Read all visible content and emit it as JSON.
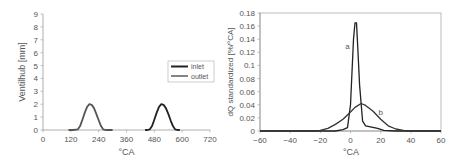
{
  "chart_data": [
    {
      "type": "line",
      "title": "",
      "xlabel": "°CA",
      "ylabel": "Ventilhub [mm]",
      "xlim": [
        0,
        720
      ],
      "ylim": [
        0,
        9
      ],
      "x_ticks": [
        0,
        120,
        240,
        360,
        480,
        600,
        720
      ],
      "y_ticks": [
        0,
        1,
        2,
        3,
        4,
        5,
        6,
        7,
        8,
        9
      ],
      "grid": false,
      "legend_position": "right-middle",
      "series": [
        {
          "name": "inlet",
          "color": "#222222",
          "x": [
            440,
            450,
            460,
            470,
            480,
            490,
            500,
            510,
            520,
            530,
            540,
            550,
            560,
            570,
            580,
            590
          ],
          "values": [
            0,
            0,
            0.05,
            0.3,
            0.8,
            1.35,
            1.8,
            2.0,
            1.95,
            1.7,
            1.25,
            0.75,
            0.3,
            0.05,
            0,
            0
          ]
        },
        {
          "name": "outlet",
          "color": "#555555",
          "x": [
            110,
            130,
            150,
            160,
            170,
            180,
            190,
            200,
            210,
            220,
            230,
            240,
            250,
            260,
            270,
            280,
            300
          ],
          "values": [
            0,
            0,
            0.05,
            0.3,
            0.8,
            1.35,
            1.8,
            2.0,
            1.95,
            1.7,
            1.25,
            0.75,
            0.3,
            0.05,
            0,
            0,
            0
          ]
        }
      ]
    },
    {
      "type": "line",
      "title": "",
      "xlabel": "°CA",
      "ylabel": "dQ standardized [%/°CA]",
      "xlim": [
        -60,
        60
      ],
      "ylim": [
        0,
        0.18
      ],
      "x_ticks": [
        -60,
        -40,
        -20,
        0,
        20,
        40,
        60
      ],
      "y_ticks": [
        0,
        0.02,
        0.04,
        0.06,
        0.08,
        0.1,
        0.12,
        0.14,
        0.16,
        0.18
      ],
      "grid": false,
      "annotations": [
        {
          "text": "a",
          "x": -2,
          "y": 0.125
        },
        {
          "text": "b",
          "x": 20,
          "y": 0.024
        }
      ],
      "series": [
        {
          "name": "a",
          "color": "#222222",
          "x": [
            -60,
            -10,
            -5,
            -2,
            0,
            1,
            2,
            3,
            4,
            5,
            6,
            8,
            10,
            14,
            18,
            22,
            30,
            60
          ],
          "values": [
            0,
            0,
            0.002,
            0.005,
            0.04,
            0.09,
            0.14,
            0.165,
            0.165,
            0.12,
            0.07,
            0.015,
            0.008,
            0.006,
            0.004,
            0.001,
            0,
            0
          ]
        },
        {
          "name": "b",
          "color": "#333333",
          "x": [
            -60,
            -25,
            -20,
            -15,
            -10,
            -5,
            0,
            3,
            7,
            10,
            15,
            20,
            25,
            30,
            35,
            40,
            60
          ],
          "values": [
            0,
            0,
            0.001,
            0.004,
            0.01,
            0.018,
            0.029,
            0.036,
            0.042,
            0.039,
            0.03,
            0.018,
            0.008,
            0.003,
            0.001,
            0,
            0
          ]
        }
      ]
    }
  ]
}
